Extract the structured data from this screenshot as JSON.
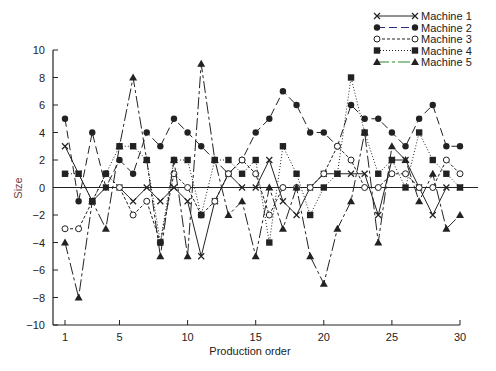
{
  "chart_data": {
    "type": "line",
    "title": "",
    "xlabel": "Production order",
    "ylabel": "Size",
    "xlim": [
      1,
      30
    ],
    "ylim": [
      -10,
      10
    ],
    "x_ticks": [
      1,
      5,
      10,
      15,
      20,
      25,
      30
    ],
    "y_ticks": [
      -10,
      -8,
      -6,
      -4,
      -2,
      0,
      2,
      4,
      6,
      8,
      10
    ],
    "grid": false,
    "zero_line": true,
    "legend_position": "top-right",
    "x": [
      1,
      2,
      3,
      4,
      5,
      6,
      7,
      8,
      9,
      10,
      11,
      12,
      13,
      14,
      15,
      16,
      17,
      18,
      19,
      20,
      21,
      22,
      23,
      24,
      25,
      26,
      27,
      28,
      29,
      30
    ],
    "series": [
      {
        "name": "Machine 1",
        "marker": "x",
        "line": "solid",
        "values": [
          3,
          1,
          -1,
          0,
          0,
          -1,
          0,
          -1,
          0,
          -1,
          -5,
          -1,
          1,
          0,
          0,
          2,
          -1,
          -2,
          0,
          1,
          1,
          1,
          1,
          -2,
          2,
          2,
          0,
          -2,
          0,
          0
        ]
      },
      {
        "name": "Machine 2",
        "marker": "filled-circle",
        "line": "dashed",
        "color": "#2a2a8a",
        "values": [
          5,
          -1,
          4,
          0,
          2,
          1,
          4,
          3,
          5,
          4,
          3,
          2,
          1,
          2,
          4,
          5,
          7,
          6,
          4,
          4,
          3,
          6,
          5,
          5,
          4,
          3,
          5,
          6,
          3,
          3
        ]
      },
      {
        "name": "Machine 3",
        "marker": "open-circle",
        "line": "dashed-short",
        "values": [
          -3,
          -3,
          -1,
          1,
          0,
          -2,
          -1,
          -4,
          1,
          0,
          -2,
          -1,
          1,
          2,
          1,
          -2,
          0,
          0,
          0,
          1,
          3,
          2,
          0,
          0,
          1,
          1,
          0,
          0,
          2,
          1
        ]
      },
      {
        "name": "Machine 4",
        "marker": "filled-square",
        "line": "dotted",
        "values": [
          1,
          1,
          -1,
          1,
          3,
          3,
          2,
          -4,
          2,
          2,
          -2,
          2,
          2,
          1,
          2,
          -4,
          3,
          1,
          -2,
          0,
          1,
          8,
          4,
          1,
          2,
          0,
          4,
          2,
          1,
          0
        ]
      },
      {
        "name": "Machine 5",
        "marker": "filled-triangle",
        "line": "long-dash",
        "color": "#2a8a2a",
        "values": [
          -4,
          -8,
          -1,
          -3,
          3,
          8,
          2,
          -5,
          2,
          -5,
          9,
          2,
          -2,
          -1,
          -5,
          0,
          -3,
          0,
          -5,
          -7,
          -3,
          -1,
          4,
          -4,
          3,
          2,
          -1,
          1,
          -3,
          -2
        ]
      }
    ]
  },
  "legend": {
    "items": [
      {
        "label": "Machine 1",
        "marker": "x",
        "color": "#222222"
      },
      {
        "label": "Machine 2",
        "marker": "filled-circle",
        "color": "#2a2a8a"
      },
      {
        "label": "Machine 3",
        "marker": "open-circle",
        "color": "#222222"
      },
      {
        "label": "Machine 4",
        "marker": "filled-square",
        "color": "#222222"
      },
      {
        "label": "Machine 5",
        "marker": "filled-triangle",
        "color": "#2a8a2a"
      }
    ]
  },
  "axes": {
    "xlabel": "Production order",
    "ylabel": "Size"
  }
}
